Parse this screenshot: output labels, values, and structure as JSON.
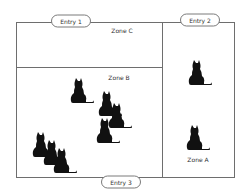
{
  "diagram": {
    "type": "floor-plan",
    "colors": {
      "border": "#6e6e6e",
      "cat": "#111111",
      "text": "#333333",
      "background": "#ffffff"
    },
    "zones": [
      {
        "id": "zone-c",
        "label": "Zone C",
        "cat_count": 0
      },
      {
        "id": "zone-b",
        "label": "Zone B",
        "cat_count": 7
      },
      {
        "id": "zone-a",
        "label": "Zone A",
        "cat_count": 2
      }
    ],
    "entries": [
      {
        "id": "entry-1",
        "label": "Entry 1"
      },
      {
        "id": "entry-2",
        "label": "Entry 2"
      },
      {
        "id": "entry-3",
        "label": "Entry 3"
      }
    ],
    "cats": [
      {
        "zone": "Zone B",
        "icon": "cat-icon"
      },
      {
        "zone": "Zone B",
        "icon": "cat-icon"
      },
      {
        "zone": "Zone B",
        "icon": "cat-icon"
      },
      {
        "zone": "Zone B",
        "icon": "cat-icon"
      },
      {
        "zone": "Zone B",
        "icon": "cat-icon"
      },
      {
        "zone": "Zone B",
        "icon": "cat-icon"
      },
      {
        "zone": "Zone B",
        "icon": "cat-icon"
      },
      {
        "zone": "Zone A",
        "icon": "cat-icon"
      },
      {
        "zone": "Zone A",
        "icon": "cat-icon"
      }
    ]
  }
}
